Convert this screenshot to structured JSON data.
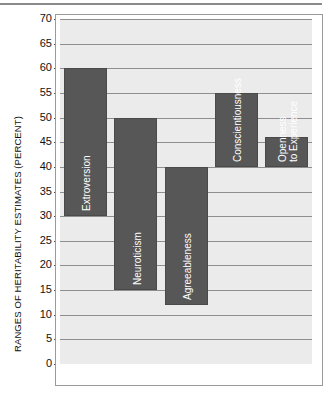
{
  "chart_data": {
    "type": "bar",
    "subtype": "floating-range-bar",
    "title": "",
    "xlabel": "",
    "ylabel": "RANGES OF HERITABILITY ESTIMATES (PERCENT)",
    "ylim": [
      0,
      70
    ],
    "ytick_step": 5,
    "yticks": [
      70,
      65,
      60,
      55,
      50,
      45,
      40,
      35,
      30,
      25,
      20,
      15,
      10,
      5,
      0
    ],
    "ytick_labels": [
      "70",
      "65",
      "60",
      "55",
      "50",
      "45",
      "40",
      "35",
      "30",
      "25",
      "20",
      "15",
      "10",
      "5",
      "0"
    ],
    "grid": true,
    "grid_axis": "y",
    "legend": false,
    "legend_position": "none",
    "xtick_labels": [],
    "categories": [
      "Extroversion",
      "Neuroticism",
      "Agreeableness",
      "Conscientiousness",
      "Openness to Experience"
    ],
    "bars": [
      {
        "label": "Extroversion",
        "label_lines": [
          "Extroversion"
        ],
        "low": 30,
        "high": 60
      },
      {
        "label": "Neuroticism",
        "label_lines": [
          "Neuroticism"
        ],
        "low": 15,
        "high": 50
      },
      {
        "label": "Agreeableness",
        "label_lines": [
          "Agreeableness"
        ],
        "low": 12,
        "high": 40
      },
      {
        "label": "Conscientiousness",
        "label_lines": [
          "Conscientiousness"
        ],
        "low": 40,
        "high": 55
      },
      {
        "label": "Openness to Experience",
        "label_lines": [
          "Openness",
          "to Experience"
        ],
        "low": 40,
        "high": 46
      }
    ],
    "lows": [
      30,
      15,
      12,
      40,
      40
    ],
    "highs": [
      60,
      50,
      40,
      55,
      46
    ],
    "values": [
      30,
      35,
      28,
      15,
      6
    ],
    "colors": {
      "bar_fill": "#575757",
      "bar_stroke": "#4a4a4a",
      "bar_label_text": "#ffffff",
      "plot_background": "#ebebeb",
      "page_background": "#ffffff",
      "gridline": "#8e8e8e",
      "axis_text": "#111111",
      "frame": "#9b9b9b"
    }
  }
}
